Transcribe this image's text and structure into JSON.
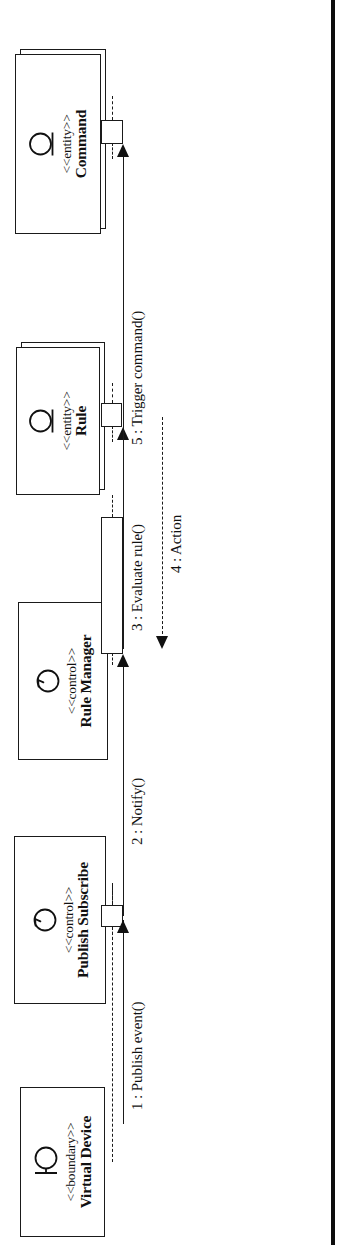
{
  "diagram": {
    "kind": "uml-sequence-diagram",
    "orientation": "rotated-90-ccw",
    "page_edge_color": "#0d0d0d",
    "line_color": "#1a1a1a"
  },
  "participants": [
    {
      "id": "command",
      "stereotype": "<<entity>>",
      "name": "Command",
      "icon": "entity-icon"
    },
    {
      "id": "rule",
      "stereotype": "<<entity>>",
      "name": "Rule",
      "icon": "entity-icon"
    },
    {
      "id": "rule-manager",
      "stereotype": "<<control>>",
      "name": "Rule Manager",
      "icon": "control-icon"
    },
    {
      "id": "publish-subscribe",
      "stereotype": "<<control>>",
      "name": "Publish Subscribe",
      "icon": "control-icon"
    },
    {
      "id": "virtual-device",
      "stereotype": "<<boundary>>",
      "name": "Virtual Device",
      "icon": "boundary-icon"
    }
  ],
  "messages": [
    {
      "number": "1",
      "label": "1 : Publish event()",
      "from": "virtual-device",
      "to": "publish-subscribe",
      "style": "solid"
    },
    {
      "number": "2",
      "label": "2 : Notify()",
      "from": "publish-subscribe",
      "to": "rule-manager",
      "style": "solid"
    },
    {
      "number": "3",
      "label": "3 : Evaluate rule()",
      "from": "rule-manager",
      "to": "rule",
      "style": "solid"
    },
    {
      "number": "4",
      "label": "4 : Action",
      "from": "rule",
      "to": "rule-manager",
      "style": "dashed"
    },
    {
      "number": "5",
      "label": "5 : Trigger command()",
      "from": "rule-manager",
      "to": "command",
      "style": "solid"
    }
  ]
}
